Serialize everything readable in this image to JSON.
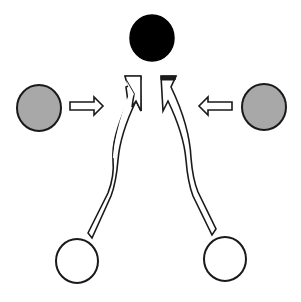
{
  "diagram": {
    "nodes": [
      {
        "id": "top",
        "fill": "#000000",
        "role": "target"
      },
      {
        "id": "left-middle",
        "fill": "#a8a8a8",
        "role": "side-input"
      },
      {
        "id": "right-middle",
        "fill": "#a8a8a8",
        "role": "side-input"
      },
      {
        "id": "bottom-left",
        "fill": "#ffffff",
        "role": "source"
      },
      {
        "id": "bottom-right",
        "fill": "#ffffff",
        "role": "source"
      }
    ],
    "edges": [
      {
        "from": "left-middle",
        "to": "center",
        "style": "hollow-straight-arrow",
        "direction": "right"
      },
      {
        "from": "right-middle",
        "to": "center",
        "style": "hollow-straight-arrow",
        "direction": "left"
      },
      {
        "from": "bottom-left",
        "to": "top",
        "style": "hollow-curved-arrow"
      },
      {
        "from": "bottom-right",
        "to": "top",
        "style": "hollow-curved-arrow"
      }
    ],
    "colors": {
      "stroke": "#1a1a1a",
      "gray_fill": "#a8a8a8",
      "black_fill": "#000000",
      "white_fill": "#ffffff"
    }
  }
}
